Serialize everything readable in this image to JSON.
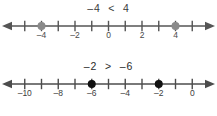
{
  "page": {
    "background_color": "#ffffff",
    "width": 217,
    "height": 116
  },
  "chart_data": {
    "type": "numberline",
    "figures": [
      {
        "id": "numberline-1",
        "caption": "–4  <  4",
        "inequality": {
          "left": "–4",
          "operator": "<",
          "right": "4"
        },
        "axis": {
          "min": -6,
          "max": 6,
          "tick_step": 1,
          "label_step": 2,
          "arrow_left": true,
          "arrow_right": true,
          "line_color": "#555555",
          "tick_color": "#555555"
        },
        "tick_labels": [
          {
            "value": -4,
            "text": "–4"
          },
          {
            "value": -2,
            "text": "–2"
          },
          {
            "value": 0,
            "text": "0"
          },
          {
            "value": 2,
            "text": "2"
          },
          {
            "value": 4,
            "text": "4"
          }
        ],
        "points": [
          {
            "value": -4,
            "filled": true,
            "color": "#8a8a8a"
          },
          {
            "value": 4,
            "filled": true,
            "color": "#8a8a8a"
          }
        ]
      },
      {
        "id": "numberline-2",
        "caption": "–2  >  –6",
        "inequality": {
          "left": "–2",
          "operator": ">",
          "right": "–6"
        },
        "axis": {
          "min": -11,
          "max": 1,
          "tick_step": 1,
          "label_step": 2,
          "arrow_left": true,
          "arrow_right": true,
          "line_color": "#4c4c4c",
          "tick_color": "#4c4c4c"
        },
        "tick_labels": [
          {
            "value": -10,
            "text": "–10"
          },
          {
            "value": -8,
            "text": "–8"
          },
          {
            "value": -6,
            "text": "–6"
          },
          {
            "value": -4,
            "text": "–4"
          },
          {
            "value": -2,
            "text": "–2"
          },
          {
            "value": 0,
            "text": "0"
          }
        ],
        "points": [
          {
            "value": -6,
            "filled": true,
            "color": "#111111"
          },
          {
            "value": -2,
            "filled": true,
            "color": "#111111"
          }
        ]
      }
    ]
  }
}
